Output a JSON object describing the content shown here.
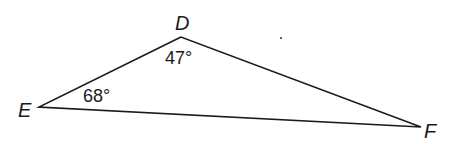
{
  "diagram": {
    "type": "triangle",
    "vertices": [
      {
        "name": "D",
        "label": "D"
      },
      {
        "name": "E",
        "label": "E"
      },
      {
        "name": "F",
        "label": "F"
      }
    ],
    "angles": [
      {
        "vertex": "D",
        "label": "47°"
      },
      {
        "vertex": "E",
        "label": "68°"
      }
    ],
    "colors": {
      "stroke": "#1a1a1a",
      "background": "#ffffff"
    }
  }
}
